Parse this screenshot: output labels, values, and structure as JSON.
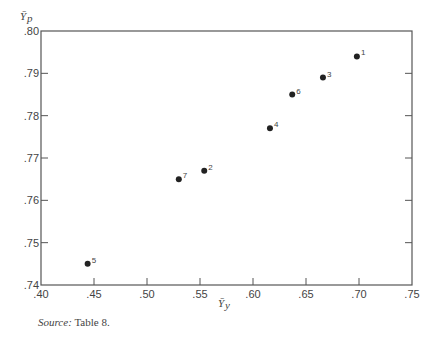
{
  "chart_data": {
    "type": "scatter",
    "title": "",
    "xlabel": "Ȳ_y",
    "ylabel": "Ȳ_p",
    "xlim": [
      0.4,
      0.75
    ],
    "ylim": [
      0.74,
      0.8
    ],
    "x_ticks": [
      ".40",
      ".45",
      ".50",
      ".55",
      ".60",
      ".65",
      ".70",
      ".75"
    ],
    "y_ticks": [
      ".74",
      ".75",
      ".76",
      ".77",
      ".78",
      ".79",
      ".80"
    ],
    "grid": false,
    "legend": null,
    "points": [
      {
        "label": "1",
        "x": 0.698,
        "y": 0.794
      },
      {
        "label": "2",
        "x": 0.554,
        "y": 0.767
      },
      {
        "label": "3",
        "x": 0.666,
        "y": 0.789
      },
      {
        "label": "4",
        "x": 0.616,
        "y": 0.777
      },
      {
        "label": "5",
        "x": 0.444,
        "y": 0.745
      },
      {
        "label": "6",
        "x": 0.637,
        "y": 0.785
      },
      {
        "label": "7",
        "x": 0.53,
        "y": 0.765
      }
    ]
  },
  "source": {
    "key": "Source:",
    "text": "Table 8."
  }
}
